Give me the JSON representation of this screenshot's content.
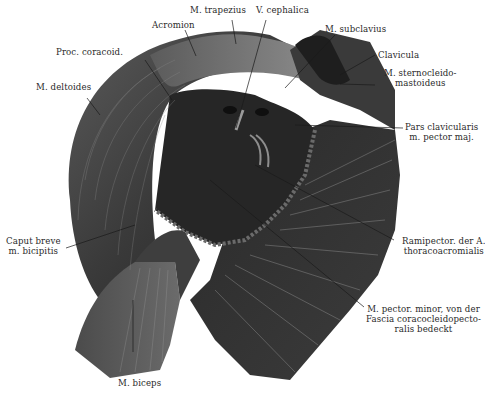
{
  "figure": {
    "colors": {
      "background": "#ffffff",
      "muscle_dark": "#2b2b2b",
      "muscle_mid": "#4a4a4a",
      "muscle_light": "#7a7a7a",
      "fascia": "#3a3a3a",
      "highlight": "#a9a9a9",
      "label_text": "#2a2a2a",
      "leader_line": "#1a1a1a"
    },
    "labels": [
      {
        "id": "trapezius",
        "lines": [
          "M. trapezius"
        ]
      },
      {
        "id": "cephalica",
        "lines": [
          "V. cephalica"
        ]
      },
      {
        "id": "acromion",
        "lines": [
          "Acromion"
        ]
      },
      {
        "id": "subclavius",
        "lines": [
          "M. subclavius"
        ]
      },
      {
        "id": "proc-coracoid",
        "lines": [
          "Proc. coracoid."
        ]
      },
      {
        "id": "clavicula",
        "lines": [
          "Clavicula"
        ]
      },
      {
        "id": "sternocleido",
        "lines": [
          "M. sternocleido-",
          "mastoideus"
        ]
      },
      {
        "id": "deltoides",
        "lines": [
          "M. deltoides"
        ]
      },
      {
        "id": "pars-clavicularis",
        "lines": [
          "Pars clavicularis",
          "m. pector maj."
        ]
      },
      {
        "id": "caput-breve",
        "lines": [
          "Caput breve",
          "m. bicipitis"
        ]
      },
      {
        "id": "rami-pector",
        "lines": [
          "Ramipector. der A.",
          "thoracoacromialis"
        ]
      },
      {
        "id": "pector-minor",
        "lines": [
          "M. pector. minor, von der",
          "Fascia coracocleidopecto-",
          "ralis bedeckt"
        ]
      },
      {
        "id": "biceps",
        "lines": [
          "M. biceps"
        ]
      }
    ]
  }
}
